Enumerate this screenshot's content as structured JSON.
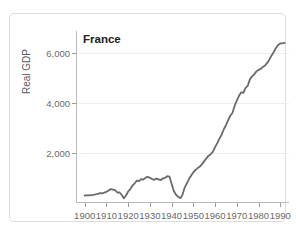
{
  "figure": {
    "top_caption": "",
    "card_label": "chart-card"
  },
  "chart_data": {
    "type": "line",
    "title": "France",
    "xlabel": "",
    "ylabel": "Real GDP",
    "xlim": [
      1896,
      1994
    ],
    "ylim": [
      0,
      6900
    ],
    "grid": true,
    "legend": "none",
    "line_color": "#6b6b6b",
    "line_width": 1.8,
    "xticks": [
      1900,
      1910,
      1920,
      1930,
      1940,
      1950,
      1960,
      1970,
      1980,
      1990
    ],
    "xtick_labels": [
      "1900",
      "1910",
      "1920",
      "1930",
      "1940",
      "1950",
      "1960",
      "1970",
      "1980",
      "1990"
    ],
    "yticks": [
      2000,
      4000,
      6000
    ],
    "ytick_labels": [
      "2,000",
      "4,000",
      "6,000"
    ],
    "x": [
      1900,
      1901,
      1902,
      1903,
      1904,
      1905,
      1906,
      1907,
      1908,
      1909,
      1910,
      1911,
      1912,
      1913,
      1914,
      1915,
      1916,
      1917,
      1918,
      1919,
      1920,
      1921,
      1922,
      1923,
      1924,
      1925,
      1926,
      1927,
      1928,
      1929,
      1930,
      1931,
      1932,
      1933,
      1934,
      1935,
      1936,
      1937,
      1938,
      1939,
      1940,
      1941,
      1942,
      1943,
      1944,
      1945,
      1946,
      1947,
      1948,
      1949,
      1950,
      1951,
      1952,
      1953,
      1954,
      1955,
      1956,
      1957,
      1958,
      1959,
      1960,
      1961,
      1962,
      1963,
      1964,
      1965,
      1966,
      1967,
      1968,
      1969,
      1970,
      1971,
      1972,
      1973,
      1974,
      1975,
      1976,
      1977,
      1978,
      1979,
      1980,
      1981,
      1982,
      1983,
      1984,
      1985,
      1986,
      1987,
      1988,
      1989,
      1990,
      1991,
      1992
    ],
    "y": [
      300,
      305,
      310,
      320,
      330,
      345,
      370,
      400,
      390,
      420,
      450,
      500,
      560,
      540,
      520,
      420,
      430,
      330,
      185,
      300,
      460,
      560,
      700,
      790,
      900,
      880,
      960,
      940,
      1020,
      1050,
      1010,
      960,
      930,
      980,
      950,
      920,
      990,
      1010,
      1075,
      1060,
      760,
      480,
      330,
      250,
      195,
      330,
      620,
      790,
      960,
      1100,
      1230,
      1330,
      1400,
      1460,
      1560,
      1680,
      1790,
      1900,
      1960,
      2060,
      2240,
      2400,
      2580,
      2740,
      2960,
      3120,
      3320,
      3500,
      3620,
      3900,
      4120,
      4300,
      4440,
      4420,
      4620,
      4700,
      4960,
      5080,
      5160,
      5280,
      5340,
      5380,
      5460,
      5520,
      5620,
      5760,
      5920,
      6060,
      6220,
      6340,
      6400,
      6400,
      6420
    ],
    "series_name": "France Real GDP",
    "annotations": [
      {
        "label": "WWI trough",
        "x": 1918,
        "y": 185
      },
      {
        "label": "WWII trough",
        "x": 1944,
        "y": 195
      }
    ]
  }
}
